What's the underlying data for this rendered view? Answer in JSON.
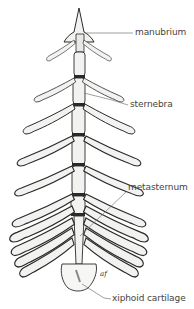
{
  "figure": {
    "colors": {
      "bone_fill": "#f2f2f0",
      "outline": "#2a2a2a",
      "shade": "#9a9a9a",
      "leader_line": "#777777",
      "label_text": "#444444"
    }
  },
  "labels": {
    "manubrium": "manubrium",
    "sternebra": "sternebra",
    "metasternum": "metasternum",
    "xiphoid": "xiphoid cartilage"
  },
  "signature": "af"
}
